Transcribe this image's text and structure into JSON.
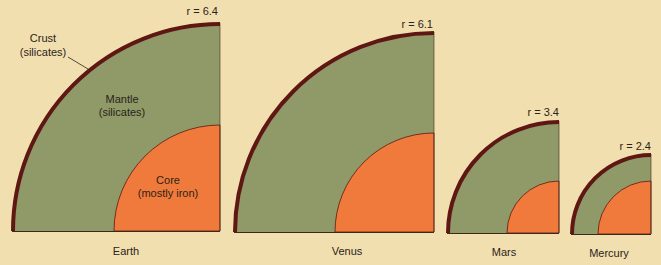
{
  "colors": {
    "background": "#f2dfb0",
    "mantle": "#8f9a68",
    "core": "#f07a3c",
    "crust": "#5e1712"
  },
  "planets": [
    {
      "name": "Earth",
      "radius_label": "r = 6.4"
    },
    {
      "name": "Venus",
      "radius_label": "r = 6.1"
    },
    {
      "name": "Mars",
      "radius_label": "r = 3.4"
    },
    {
      "name": "Mercury",
      "radius_label": "r = 2.4"
    }
  ],
  "annotations": {
    "crust": [
      "Crust",
      "(silicates)"
    ],
    "mantle": [
      "Mantle",
      "(silicates)"
    ],
    "core": [
      "Core",
      "(mostly iron)"
    ]
  }
}
